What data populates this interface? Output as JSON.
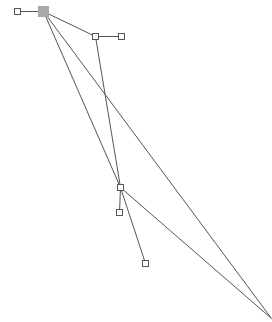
{
  "diagram": {
    "colors": {
      "edge": "#555555",
      "node_fill": "#ffffff",
      "node_stroke": "#555555",
      "selected_node": "#a8a8a8"
    },
    "nodes": [
      {
        "id": "n0",
        "x": 17,
        "y": 11,
        "size": 6,
        "selected": false
      },
      {
        "id": "n1",
        "x": 43,
        "y": 11,
        "size": 10,
        "selected": true
      },
      {
        "id": "n2",
        "x": 95,
        "y": 36,
        "size": 6,
        "selected": false
      },
      {
        "id": "n3",
        "x": 121,
        "y": 36,
        "size": 6,
        "selected": false
      },
      {
        "id": "n4",
        "x": 120,
        "y": 187,
        "size": 6,
        "selected": false
      },
      {
        "id": "n5",
        "x": 119,
        "y": 212,
        "size": 6,
        "selected": false
      },
      {
        "id": "n6",
        "x": 145,
        "y": 263,
        "size": 6,
        "selected": false
      },
      {
        "id": "n7",
        "x": 271,
        "y": 318,
        "size": 0,
        "selected": false
      }
    ],
    "edges": [
      {
        "from": "n0",
        "to": "n1"
      },
      {
        "from": "n1",
        "to": "n2"
      },
      {
        "from": "n2",
        "to": "n3"
      },
      {
        "from": "n1",
        "to": "n4"
      },
      {
        "from": "n2",
        "to": "n4"
      },
      {
        "from": "n1",
        "to": "n7"
      },
      {
        "from": "n4",
        "to": "n5"
      },
      {
        "from": "n4",
        "to": "n6"
      },
      {
        "from": "n4",
        "to": "n7"
      }
    ]
  }
}
